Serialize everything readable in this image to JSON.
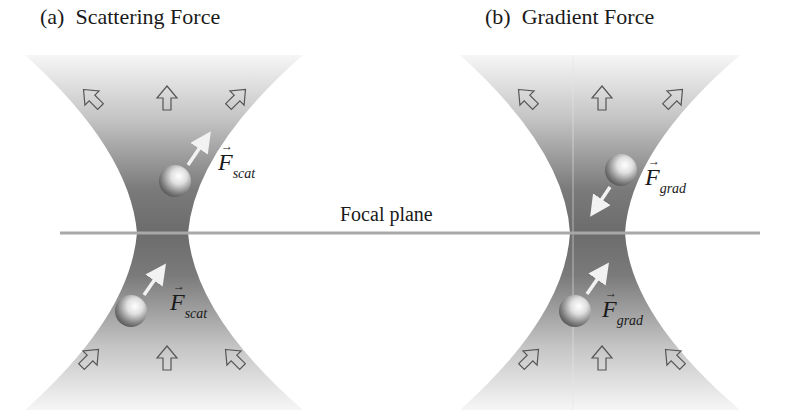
{
  "panels": [
    {
      "id": "a",
      "title": "(a)  Scattering Force",
      "force_labels": [
        {
          "symbol": "F",
          "subscript": "scat"
        },
        {
          "symbol": "F",
          "subscript": "scat"
        }
      ],
      "description": "Particles above and below focus both pushed along beam propagation direction"
    },
    {
      "id": "b",
      "title": "(b)  Gradient Force",
      "force_labels": [
        {
          "symbol": "F",
          "subscript": "grad"
        },
        {
          "symbol": "F",
          "subscript": "grad"
        }
      ],
      "description": "Particles above and below focus both pulled toward focal point"
    }
  ],
  "focal_plane": {
    "label": "Focal plane"
  },
  "colors": {
    "beam_dark": "#6e6e6e",
    "beam_light": "#f4f4f4",
    "line": "#a8a8a8",
    "arrow": "#f2f2f2",
    "text": "#1a1a1a"
  }
}
